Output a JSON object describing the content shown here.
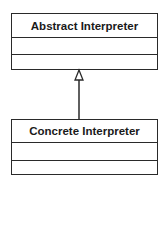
{
  "diagram": {
    "type": "uml-class-inheritance",
    "classes": [
      {
        "name": "Abstract Interpreter",
        "attributes": [],
        "operations": []
      },
      {
        "name": "Concrete Interpreter",
        "attributes": [],
        "operations": []
      }
    ],
    "relationship": {
      "type": "generalization",
      "from": "Concrete Interpreter",
      "to": "Abstract Interpreter"
    },
    "colors": {
      "line": "#2a2a2a",
      "text": "#1a1a1a",
      "background": "#ffffff"
    }
  }
}
